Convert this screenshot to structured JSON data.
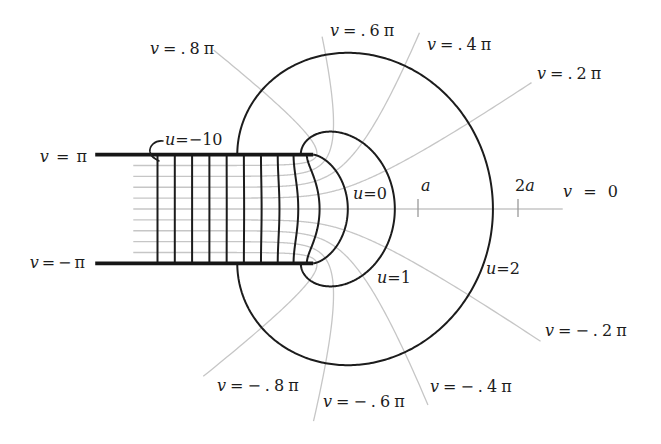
{
  "figure": {
    "colors": {
      "ink": "#1c1c1c",
      "grid": "#c6c6c6",
      "tick": "#9a9a9a",
      "background": "#ffffff"
    },
    "plates": {
      "u_range": [
        -13.6,
        0
      ],
      "top": {
        "v_over_pi": 1,
        "var": "v",
        "expr": " = π"
      },
      "bottom": {
        "v_over_pi": -1,
        "var": "v",
        "expr": "=−π"
      }
    },
    "strip_u_lines": {
      "values": [
        -10,
        -9,
        -8,
        -7,
        -6,
        -5,
        -4,
        -3,
        -2,
        -1
      ],
      "annotation": {
        "var": "u",
        "expr": "=−10"
      }
    },
    "u_curves": [
      {
        "u": 0,
        "var": "u",
        "expr": "=0"
      },
      {
        "u": 1,
        "var": "u",
        "expr": "=1"
      },
      {
        "u": 2,
        "var": "u",
        "expr": "=2"
      }
    ],
    "v_lines": [
      {
        "v_over_pi": 0.8,
        "var": "v",
        "expr": "=.8π",
        "u_range": [
          -11.4,
          2.43
        ]
      },
      {
        "v_over_pi": 0.6,
        "var": "v",
        "expr": "=.6π",
        "u_range": [
          -11.4,
          2.14
        ]
      },
      {
        "v_over_pi": 0.4,
        "var": "v",
        "expr": "=.4π",
        "u_range": [
          -11.4,
          2.24
        ]
      },
      {
        "v_over_pi": 0.2,
        "var": "v",
        "expr": "=.2π",
        "u_range": [
          -11.4,
          2.43
        ]
      },
      {
        "v_over_pi": 0,
        "var": "v",
        "expr": " = 0",
        "u_range": [
          -11.4,
          2.4
        ]
      },
      {
        "v_over_pi": -0.2,
        "var": "v",
        "expr": "=−.2π",
        "u_range": [
          -11.4,
          2.48
        ]
      },
      {
        "v_over_pi": -0.4,
        "var": "v",
        "expr": "=−.4π",
        "u_range": [
          -11.4,
          2.36
        ]
      },
      {
        "v_over_pi": -0.6,
        "var": "v",
        "expr": "=−.6π",
        "u_range": [
          -11.4,
          2.39
        ]
      },
      {
        "v_over_pi": -0.8,
        "var": "v",
        "expr": "=−.8π",
        "u_range": [
          -11.4,
          2.5
        ]
      }
    ],
    "axis_ticks": [
      {
        "coef": "",
        "var": "a"
      },
      {
        "coef": "2",
        "var": "a"
      }
    ]
  }
}
